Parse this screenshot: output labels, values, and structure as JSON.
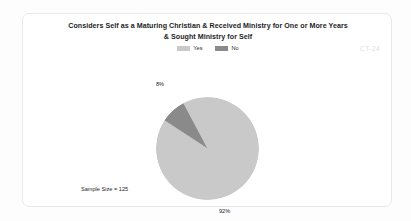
{
  "document": {
    "watermark": "CT-24"
  },
  "chart_card": {
    "title_line_1": "Considers Self as a Maturing Christian & Received Ministry for One or More Years",
    "title_line_2": "& Sought Ministry for Self",
    "sample_size_text": "Sample Size = 125"
  },
  "legend": {
    "items": [
      {
        "label": "Yes",
        "color": "#c9c9c9"
      },
      {
        "label": "No",
        "color": "#8a8a8a"
      }
    ]
  },
  "chart_data": {
    "type": "pie",
    "title": "Considers Self as a Maturing Christian & Received Ministry for One or More Years & Sought Ministry for Self",
    "categories": [
      "Yes",
      "No"
    ],
    "values": [
      92,
      8
    ],
    "value_unit": "%",
    "data_labels": [
      "92%",
      "8%"
    ],
    "colors": [
      "#c9c9c9",
      "#8a8a8a"
    ],
    "sample_size": 125,
    "sample_size_label": "Sample Size = 125",
    "legend_position": "top",
    "grid": false,
    "start_angle_deg": -28,
    "annotations": [
      "CT-24"
    ]
  }
}
